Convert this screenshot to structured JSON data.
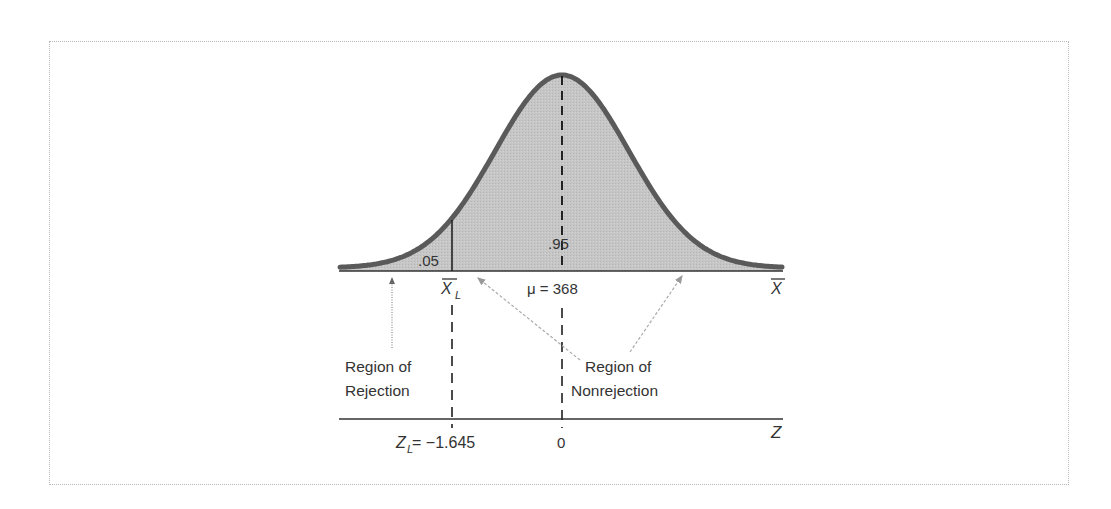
{
  "chart_data": {
    "type": "area",
    "title": "",
    "distribution": "normal",
    "mean_label": "μ = 368",
    "mean": 368,
    "critical_z": -1.645,
    "critical_x_label": "X̄_L",
    "critical_z_label": "Z_L = −1.645",
    "z_zero_label": "0",
    "upper_axis_label": "X̄",
    "lower_axis_label": "Z",
    "areas": [
      {
        "name": "Region of Rejection",
        "value": 0.05,
        "label": ".05"
      },
      {
        "name": "Region of Nonrejection",
        "value": 0.95,
        "label": ".95"
      }
    ],
    "annotations": [
      "Region of Rejection",
      "Region of Nonrejection"
    ],
    "colors": {
      "fill": "#c4c4c4",
      "curve": "#5a5a5a",
      "axis": "#333333",
      "arrow": "#999999"
    }
  },
  "labels": {
    "area_left": ".05",
    "area_center": ".95",
    "xbar_l": "X",
    "xbar_l_sub": "L",
    "mu": "μ = 368",
    "xbar": "X",
    "rejection_line1": "Region of",
    "rejection_line2": "Rejection",
    "nonrejection_line1": "Region of",
    "nonrejection_line2": "Nonrejection",
    "zl": "Z",
    "zl_sub": "L",
    "zl_value": " = −1.645",
    "zero": "0",
    "z": "Z"
  }
}
